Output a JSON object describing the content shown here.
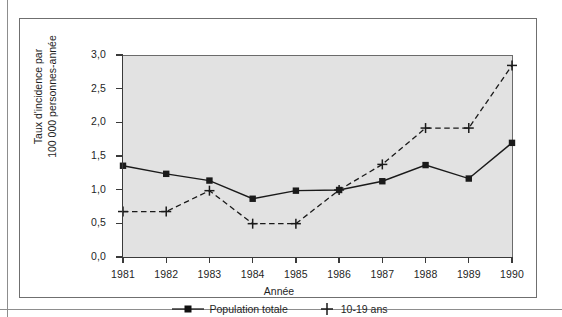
{
  "figure": {
    "xlabel": "Année",
    "ylabel_line1": "Taux d'incidence par",
    "ylabel_line2": "100 000 personnes-année"
  },
  "axis": {
    "y_ticks": [
      "0,0",
      "0,5",
      "1,0",
      "1,5",
      "2,0",
      "2,5",
      "3,0"
    ],
    "x_ticks": [
      "1981",
      "1982",
      "1983",
      "1984",
      "1985",
      "1986",
      "1987",
      "1988",
      "1989",
      "1990"
    ]
  },
  "legend": {
    "entries": [
      {
        "label": "Population totale",
        "marker": "square-marker",
        "line": "solid"
      },
      {
        "label": "10-19 ans",
        "marker": "plus-marker",
        "line": "dashed"
      }
    ]
  },
  "colors": {
    "plot_background": "#e2e2e2",
    "axis": "#3a3a3a",
    "series": "#1a1a1a",
    "frame": "#6f6f6f"
  },
  "chart_data": {
    "type": "line",
    "title": "",
    "xlabel": "Année",
    "ylabel": "Taux d'incidence par 100 000 personnes-année",
    "x": [
      1981,
      1982,
      1983,
      1984,
      1985,
      1986,
      1987,
      1988,
      1989,
      1990
    ],
    "categories": [
      "1981",
      "1982",
      "1983",
      "1984",
      "1985",
      "1986",
      "1987",
      "1988",
      "1989",
      "1990"
    ],
    "xlim": [
      1981,
      1990
    ],
    "ylim": [
      0.0,
      3.0
    ],
    "ytick_values": [
      0.0,
      0.5,
      1.0,
      1.5,
      2.0,
      2.5,
      3.0
    ],
    "grid": false,
    "legend_position": "bottom",
    "series": [
      {
        "name": "Population totale",
        "linestyle": "solid",
        "marker": "square",
        "color": "#1a1a1a",
        "values": [
          1.37,
          1.25,
          1.15,
          0.88,
          1.0,
          1.01,
          1.14,
          1.38,
          1.18,
          1.71
        ]
      },
      {
        "name": "10-19 ans",
        "linestyle": "dashed",
        "marker": "plus",
        "color": "#1a1a1a",
        "values": [
          0.69,
          0.69,
          1.0,
          0.51,
          0.51,
          1.01,
          1.39,
          1.93,
          1.93,
          2.86
        ]
      }
    ]
  }
}
